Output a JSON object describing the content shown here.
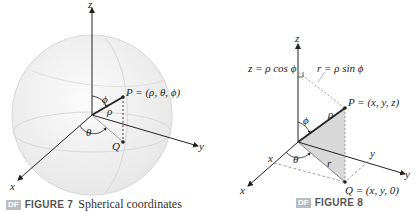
{
  "figure7": {
    "badge": "DF",
    "label": "FIGURE 7",
    "caption": "Spherical coordinates",
    "axes": {
      "x": "x",
      "y": "y",
      "z": "z"
    },
    "point_label": "P = (ρ, θ, ϕ)",
    "projection_label": "Q",
    "rho": "ρ",
    "theta": "θ",
    "phi": "ϕ"
  },
  "figure8": {
    "badge": "DF",
    "label": "FIGURE 8",
    "caption": "",
    "axes": {
      "x": "x",
      "y": "y",
      "z": "z"
    },
    "z_formula": "z = ρ cos ϕ",
    "r_formula": "r = ρ sin ϕ",
    "point_label": "P = (x, y, z)",
    "projection_label": "Q = (x, y, 0)",
    "rho": "ρ",
    "theta": "θ",
    "phi": "ϕ",
    "r": "r",
    "x_tick": "x",
    "y_tick": "y"
  },
  "colors": {
    "sphere_fill": "#f0f0f0",
    "sphere_edge": "#d6d6d6",
    "triangle_fill": "#d8d8d8",
    "badge": "#b8bcc4",
    "line": "#222222"
  }
}
